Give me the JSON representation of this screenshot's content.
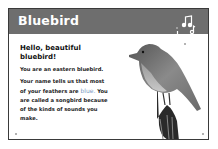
{
  "header": {
    "title": "Bluebird",
    "icon": "music-notes-icon"
  },
  "body": {
    "greeting": "Hello, beautiful bluebird!",
    "paragraph1": "You are an eastern bluebird.",
    "paragraph2_pre": "Your name tells us that most of your feathers are ",
    "paragraph2_highlight": "blue.",
    "paragraph2_post": " You are called a songbird because of the kinds of sounds you make."
  },
  "image": {
    "subject": "bluebird-on-post-image"
  },
  "colors": {
    "header": "#6e6e6e",
    "highlight": "#7d9cc4"
  }
}
